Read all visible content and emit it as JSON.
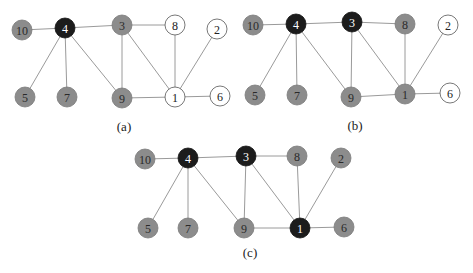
{
  "figure": {
    "styles": {
      "black": {
        "fill": "#1c1c1c",
        "stroke": "#111111",
        "text": "#ffffff"
      },
      "gray": {
        "fill": "#8c8c8c",
        "stroke": "#7a7a7a",
        "text": "#2a2a2a"
      },
      "white": {
        "fill": "#ffffff",
        "stroke": "#555555",
        "text": "#222222"
      }
    },
    "edges": [
      [
        10,
        4
      ],
      [
        4,
        3
      ],
      [
        3,
        8
      ],
      [
        4,
        5
      ],
      [
        4,
        7
      ],
      [
        4,
        9
      ],
      [
        3,
        9
      ],
      [
        3,
        1
      ],
      [
        8,
        1
      ],
      [
        2,
        1
      ],
      [
        9,
        1
      ],
      [
        1,
        6
      ]
    ],
    "panels": [
      {
        "id": "a",
        "caption": "(a)",
        "node_states": {
          "1": "white",
          "2": "white",
          "3": "gray",
          "4": "black",
          "5": "gray",
          "6": "white",
          "7": "gray",
          "8": "white",
          "9": "gray",
          "10": "gray"
        }
      },
      {
        "id": "b",
        "caption": "(b)",
        "node_states": {
          "1": "gray",
          "2": "white",
          "3": "black",
          "4": "black",
          "5": "gray",
          "6": "white",
          "7": "gray",
          "8": "gray",
          "9": "gray",
          "10": "gray"
        }
      },
      {
        "id": "c",
        "caption": "(c)",
        "node_states": {
          "1": "black",
          "2": "gray",
          "3": "black",
          "4": "black",
          "5": "gray",
          "6": "gray",
          "7": "gray",
          "8": "gray",
          "9": "gray",
          "10": "gray"
        }
      }
    ]
  }
}
